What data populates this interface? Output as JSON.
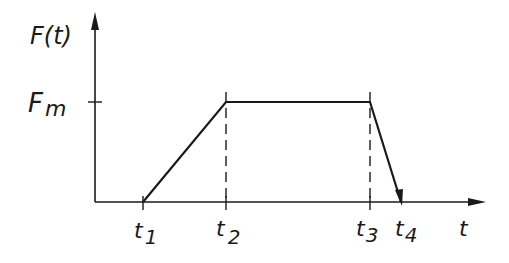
{
  "diagram": {
    "type": "trapezoidal force-time profile",
    "y_axis": {
      "label": "F(t)"
    },
    "x_axis": {
      "label": "t"
    },
    "level_label": "F",
    "level_label_sub": "m",
    "time_marks": [
      {
        "base": "t",
        "sub": "1"
      },
      {
        "base": "t",
        "sub": "2"
      },
      {
        "base": "t",
        "sub": "3"
      },
      {
        "base": "t",
        "sub": "4"
      }
    ],
    "segments": [
      {
        "from": "t1",
        "to": "t2",
        "shape": "linear rise from 0 to Fm"
      },
      {
        "from": "t2",
        "to": "t3",
        "shape": "constant at Fm"
      },
      {
        "from": "t3",
        "to": "t4",
        "shape": "linear fall from Fm to 0"
      }
    ],
    "colors": {
      "ink": "#1a1a1a",
      "background": "#ffffff"
    }
  }
}
